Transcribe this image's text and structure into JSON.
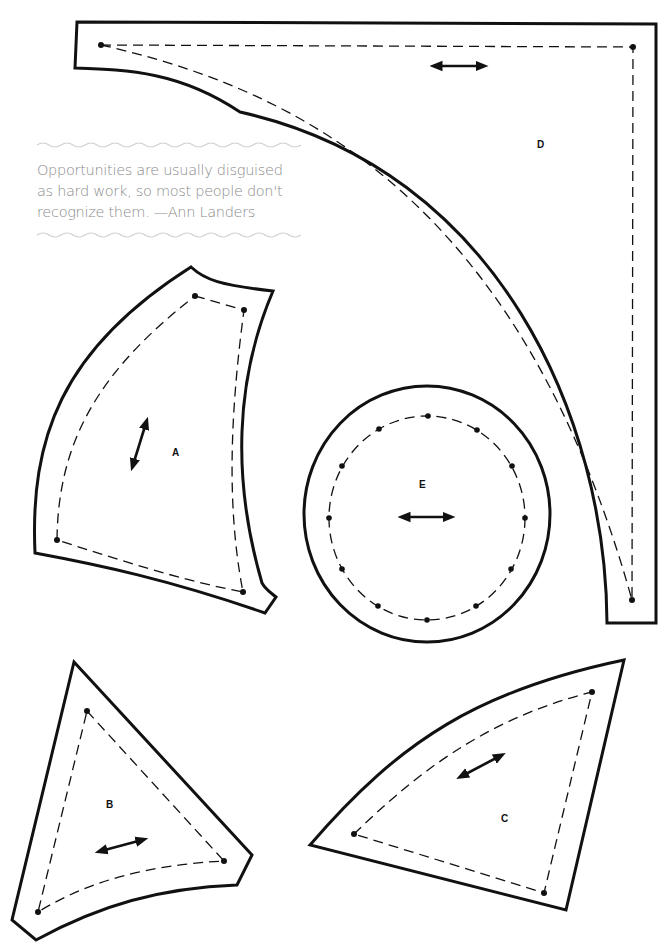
{
  "quote": {
    "lines": [
      "Opportunities are usually disguised",
      "as hard work, so most people don't",
      "recognize them. —Ann Landers"
    ],
    "text_color": "#8a8a8a"
  },
  "pieces": [
    {
      "id": "A",
      "label": "A",
      "grainline": "diagonal"
    },
    {
      "id": "B",
      "label": "B",
      "grainline": "diagonal"
    },
    {
      "id": "C",
      "label": "C",
      "grainline": "diagonal"
    },
    {
      "id": "D",
      "label": "D",
      "grainline": "horizontal"
    },
    {
      "id": "E",
      "label": "E",
      "grainline": "horizontal"
    }
  ],
  "legend": {
    "cut_line": "solid",
    "seam_line": "dashed",
    "grainline_icon": "double-arrow-icon"
  },
  "colors": {
    "line": "#111111",
    "background": "#ffffff"
  }
}
